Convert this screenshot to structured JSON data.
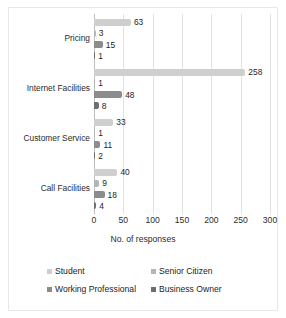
{
  "chart_data": {
    "type": "bar",
    "orientation": "horizontal",
    "title": "",
    "xlabel": "No. of responses",
    "ylabel": "",
    "xlim": [
      0,
      300
    ],
    "xticks": [
      "0",
      "50",
      "100",
      "150",
      "200",
      "250",
      "300"
    ],
    "grid": true,
    "legend_position": "bottom",
    "categories": [
      "Pricing",
      "Internet Facilities",
      "Customer Service",
      "Call Facilities"
    ],
    "series": [
      {
        "name": "Student",
        "color": "#cfcfcf",
        "values": [
          63,
          258,
          33,
          40
        ]
      },
      {
        "name": "Senior Citizen",
        "color": "#b5b5b5",
        "values": [
          3,
          1,
          1,
          9
        ]
      },
      {
        "name": "Working Professional",
        "color": "#8c8c8c",
        "values": [
          15,
          48,
          11,
          18
        ]
      },
      {
        "name": "Business Owner",
        "color": "#6e6e6e",
        "values": [
          1,
          8,
          2,
          4
        ]
      }
    ]
  },
  "colors": {
    "grid": "#e2e2e2",
    "axis": "#bdbdbd",
    "text": "#1d1d1d",
    "frame": "#e8e8e8"
  }
}
